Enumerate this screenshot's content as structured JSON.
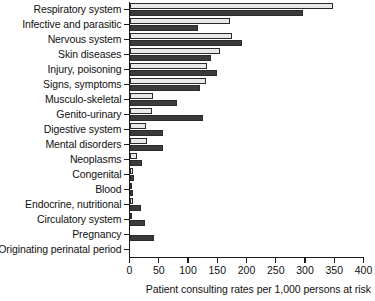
{
  "chart_data": {
    "type": "bar",
    "orientation": "horizontal",
    "title": "",
    "xlabel": "Patient consulting rates per 1,000 persons at risk",
    "ylabel": "",
    "xlim": [
      0,
      400
    ],
    "xticks": [
      0,
      50,
      100,
      150,
      200,
      250,
      300,
      350,
      400
    ],
    "grid": false,
    "legend": null,
    "categories": [
      "Respiratory system",
      "Infective and parasitic",
      "Nervous system",
      "Skin diseases",
      "Injury, poisoning",
      "Signs, symptoms",
      "Musculo-skeletal",
      "Genito-urinary",
      "Digestive system",
      "Mental disorders",
      "Neoplasms",
      "Congenital",
      "Blood",
      "Endocrine, nutritional",
      "Circulatory system",
      "Pregnancy",
      "Originating perinatal period"
    ],
    "series": [
      {
        "name": "series-light",
        "style": "light",
        "values": [
          348,
          172,
          175,
          155,
          132,
          130,
          40,
          38,
          28,
          30,
          13,
          6,
          5,
          6,
          4,
          0,
          0
        ]
      },
      {
        "name": "series-dark",
        "style": "dark",
        "values": [
          297,
          117,
          193,
          140,
          150,
          120,
          82,
          125,
          58,
          58,
          21,
          7,
          6,
          20,
          26,
          42,
          0
        ]
      }
    ]
  },
  "axis": {
    "x_tick_labels": [
      "0",
      "50",
      "100",
      "150",
      "200",
      "250",
      "300",
      "350",
      "400"
    ],
    "x_axis_title": "Patient consulting rates per 1,000 persons at risk"
  }
}
